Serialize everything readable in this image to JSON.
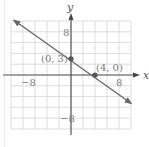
{
  "chart_data": {
    "type": "line",
    "title": "",
    "xlabel": "x",
    "ylabel": "y",
    "xlim": [
      -10,
      10
    ],
    "ylim": [
      -10,
      10
    ],
    "grid": true,
    "grid_step": 2,
    "x_tick_labels": [
      {
        "value": -8,
        "label": "−8"
      },
      {
        "value": 8,
        "label": "8"
      }
    ],
    "y_tick_labels": [
      {
        "value": 8,
        "label": "8"
      },
      {
        "value": -8,
        "label": "−8"
      }
    ],
    "series": [
      {
        "name": "line",
        "equation": "y = -3/4 x + 3",
        "x": [
          -10,
          10
        ],
        "y": [
          10.5,
          -4.5
        ],
        "arrows": "both",
        "color": "#666666"
      }
    ],
    "points": [
      {
        "x": 0,
        "y": 3,
        "label": "(0, 3)"
      },
      {
        "x": 4,
        "y": 0,
        "label": "(4, 0)"
      }
    ]
  },
  "colors": {
    "grid": "#d4d4d4",
    "axis": "#555555",
    "line": "#666666",
    "point": "#555555",
    "text": "#7a7a7a"
  }
}
